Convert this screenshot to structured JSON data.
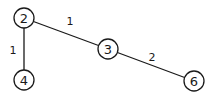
{
  "diagram": {
    "type": "weighted-graph",
    "nodes": [
      {
        "id": "2",
        "label": "2",
        "x": 24,
        "y": 18
      },
      {
        "id": "3",
        "label": "3",
        "x": 108,
        "y": 49
      },
      {
        "id": "4",
        "label": "4",
        "x": 24,
        "y": 80
      },
      {
        "id": "6",
        "label": "6",
        "x": 194,
        "y": 81
      }
    ],
    "edges": [
      {
        "from": "2",
        "to": "3",
        "weight": "1",
        "label_x": 70,
        "label_y": 21
      },
      {
        "from": "2",
        "to": "4",
        "weight": "1",
        "label_x": 13,
        "label_y": 50
      },
      {
        "from": "3",
        "to": "6",
        "weight": "2",
        "label_x": 152,
        "label_y": 57
      }
    ],
    "node_radius": 10,
    "colors": {
      "stroke": "#1a1a1a",
      "fill": "#ffffff",
      "background": "#ffffff"
    }
  }
}
